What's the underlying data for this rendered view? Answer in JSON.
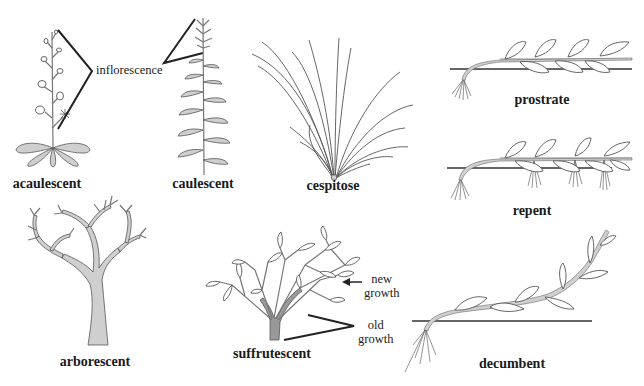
{
  "figure": {
    "type": "botanical-diagram"
  },
  "habits": [
    {
      "id": "acaulescent",
      "label": "acaulescent"
    },
    {
      "id": "caulescent",
      "label": "caulescent"
    },
    {
      "id": "cespitose",
      "label": "cespitose"
    },
    {
      "id": "prostrate",
      "label": "prostrate"
    },
    {
      "id": "repent",
      "label": "repent"
    },
    {
      "id": "arborescent",
      "label": "arborescent"
    },
    {
      "id": "suffrutescent",
      "label": "suffrutescent"
    },
    {
      "id": "decumbent",
      "label": "decumbent"
    }
  ],
  "annotations": {
    "inflorescence": "inflorescence",
    "new_growth_line1": "new",
    "new_growth_line2": "growth",
    "old_growth_line1": "old",
    "old_growth_line2": "growth"
  },
  "colors": {
    "background": "#ffffff",
    "line": "#555555",
    "fill": "#cfcfcf",
    "text": "#1a1a1a"
  }
}
